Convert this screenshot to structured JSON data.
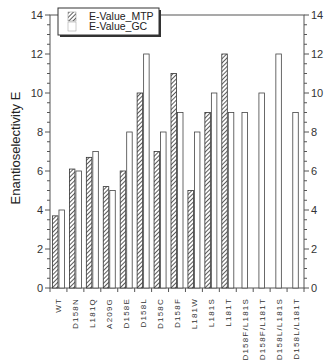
{
  "chart_data": {
    "type": "bar",
    "title": "",
    "xlabel": "",
    "ylabel": "Enantioselectivity E",
    "ylim": [
      0,
      14
    ],
    "yticks": [
      0,
      2,
      4,
      6,
      8,
      10,
      12,
      14
    ],
    "grid": false,
    "legend_position": "upper-left",
    "categories": [
      "WT",
      "D158N",
      "L181Q",
      "A209G",
      "D158E",
      "D158L",
      "D158C",
      "D158F",
      "L181W",
      "L181S",
      "L181T",
      "D158F/L181S",
      "D158F/L181T",
      "D158L/L181S",
      "D158L/L181T"
    ],
    "series": [
      {
        "name": "E-Value_MTP",
        "pattern": "hatched",
        "values": [
          3.7,
          6.1,
          6.7,
          5.2,
          6.0,
          10.0,
          7.0,
          11.0,
          5.0,
          9.0,
          12.0,
          null,
          null,
          null,
          null
        ]
      },
      {
        "name": "E-Value_GC",
        "pattern": "open",
        "values": [
          4.0,
          6.0,
          7.0,
          5.0,
          8.0,
          12.0,
          8.0,
          9.0,
          8.0,
          10.0,
          9.0,
          9.0,
          10.0,
          12.0,
          9.0
        ]
      }
    ]
  },
  "legend": {
    "items": [
      "E-Value_MTP",
      "E-Value_GC"
    ]
  }
}
